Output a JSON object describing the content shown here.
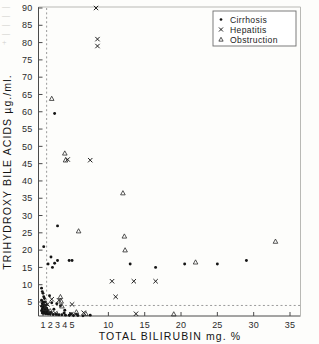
{
  "chart_data": {
    "type": "scatter",
    "title": "",
    "xlabel": "TOTAL BILIRUBIN mg. %",
    "ylabel": "TRIHYDROXY BILE ACIDS µg./ml.",
    "xlim": [
      0,
      37.5
    ],
    "ylim": [
      0,
      90
    ],
    "xticks": [
      1,
      2,
      3,
      4,
      5,
      10,
      15,
      20,
      25,
      30,
      35
    ],
    "xticklabels": [
      "1",
      "2",
      "3",
      "4",
      "5",
      "10",
      "15",
      "20",
      "25",
      "30",
      "35"
    ],
    "yticks": [
      5,
      10,
      15,
      20,
      25,
      30,
      35,
      40,
      45,
      50,
      55,
      60,
      65,
      70,
      75,
      80,
      85,
      90
    ],
    "yticklabels": [
      "5",
      "10",
      "15",
      "20",
      "25",
      "30",
      "35",
      "40",
      "45",
      "50",
      "55",
      "60",
      "65",
      "70",
      "75",
      "80",
      "85",
      "90"
    ],
    "grid": false,
    "reference_lines": [
      {
        "orientation": "vertical",
        "value": 1.5,
        "style": "dashed"
      },
      {
        "orientation": "horizontal",
        "value": 4.0,
        "style": "dashed"
      }
    ],
    "legend": {
      "position": "top-right",
      "entries": [
        {
          "label": "Cirrhosis",
          "marker": "dot"
        },
        {
          "label": "Hepatitis",
          "marker": "x"
        },
        {
          "label": "Obstruction",
          "marker": "triangle"
        }
      ]
    },
    "series": [
      {
        "name": "Cirrhosis",
        "marker": "dot",
        "points": [
          [
            2.6,
            59.5
          ],
          [
            1.1,
            21.0
          ],
          [
            3.0,
            27.0
          ],
          [
            2.1,
            18.0
          ],
          [
            3.0,
            17.0
          ],
          [
            4.6,
            17.0
          ],
          [
            5.0,
            17.0
          ],
          [
            1.7,
            16.0
          ],
          [
            2.6,
            16.2
          ],
          [
            2.3,
            15.0
          ],
          [
            13.0,
            16.0
          ],
          [
            16.5,
            15.0
          ],
          [
            20.5,
            16.0
          ],
          [
            25.0,
            16.0
          ],
          [
            29.0,
            17.0
          ],
          [
            0.8,
            9.0
          ],
          [
            0.9,
            8.0
          ],
          [
            1.0,
            7.5
          ],
          [
            1.1,
            6.5
          ],
          [
            1.2,
            6.0
          ],
          [
            0.8,
            5.5
          ],
          [
            1.0,
            5.0
          ],
          [
            1.3,
            5.0
          ],
          [
            0.9,
            4.5
          ],
          [
            1.1,
            4.2
          ],
          [
            1.4,
            4.0
          ],
          [
            0.8,
            3.8
          ],
          [
            1.0,
            3.5
          ],
          [
            1.2,
            3.4
          ],
          [
            1.5,
            3.2
          ],
          [
            0.9,
            3.0
          ],
          [
            1.1,
            2.9
          ],
          [
            1.3,
            2.7
          ],
          [
            1.6,
            2.6
          ],
          [
            0.8,
            2.5
          ],
          [
            1.0,
            2.4
          ],
          [
            1.2,
            2.2
          ],
          [
            1.5,
            2.1
          ],
          [
            1.8,
            2.0
          ],
          [
            2.1,
            2.0
          ],
          [
            0.9,
            1.8
          ],
          [
            1.1,
            1.7
          ],
          [
            1.4,
            1.6
          ],
          [
            1.7,
            1.5
          ],
          [
            2.0,
            1.5
          ],
          [
            2.4,
            1.4
          ],
          [
            2.8,
            1.4
          ],
          [
            3.2,
            1.3
          ],
          [
            3.6,
            1.3
          ],
          [
            4.1,
            1.2
          ],
          [
            4.6,
            1.2
          ],
          [
            5.2,
            1.1
          ],
          [
            5.8,
            1.1
          ],
          [
            6.5,
            1.0
          ],
          [
            7.5,
            1.2
          ],
          [
            2.2,
            4.8
          ],
          [
            2.9,
            4.5
          ],
          [
            3.4,
            3.9
          ],
          [
            4.0,
            2.6
          ],
          [
            1.9,
            6.8
          ],
          [
            2.5,
            2.9
          ],
          [
            3.9,
            1.8
          ],
          [
            4.8,
            1.6
          ],
          [
            5.6,
            1.5
          ]
        ]
      },
      {
        "name": "Hepatitis",
        "marker": "x",
        "points": [
          [
            8.3,
            90.0
          ],
          [
            8.5,
            81.0
          ],
          [
            8.5,
            79.0
          ],
          [
            4.4,
            46.2
          ],
          [
            7.5,
            46.0
          ],
          [
            10.5,
            11.0
          ],
          [
            13.5,
            11.0
          ],
          [
            11.0,
            6.5
          ],
          [
            16.5,
            11.0
          ],
          [
            2.2,
            5.8
          ],
          [
            3.2,
            5.5
          ],
          [
            1.6,
            4.3
          ],
          [
            5.0,
            4.3
          ],
          [
            1.5,
            2.2
          ],
          [
            6.6,
            1.9
          ],
          [
            13.8,
            1.6
          ],
          [
            2.7,
            1.8
          ],
          [
            4.9,
            1.4
          ]
        ]
      },
      {
        "name": "Obstruction",
        "marker": "triangle",
        "points": [
          [
            2.2,
            63.8
          ],
          [
            4.0,
            48.0
          ],
          [
            4.1,
            46.0
          ],
          [
            5.9,
            25.5
          ],
          [
            12.0,
            36.5
          ],
          [
            12.2,
            24.0
          ],
          [
            12.3,
            20.0
          ],
          [
            22.0,
            16.5
          ],
          [
            33.0,
            22.5
          ],
          [
            3.4,
            6.5
          ],
          [
            3.5,
            5.2
          ],
          [
            1.4,
            4.6
          ],
          [
            3.6,
            3.8
          ],
          [
            5.6,
            2.1
          ],
          [
            6.9,
            1.6
          ],
          [
            19.0,
            1.5
          ],
          [
            2.0,
            2.4
          ],
          [
            1.3,
            3.1
          ]
        ]
      }
    ]
  },
  "bleed_text": {
    "lines": [
      "—",
      "—",
      "—",
      "—",
      "+"
    ]
  }
}
